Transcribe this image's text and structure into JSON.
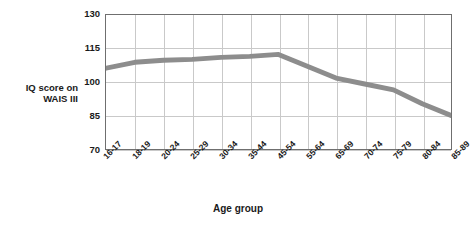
{
  "chart_data": {
    "type": "line",
    "title": "",
    "xlabel": "Age group",
    "ylabel": "IQ score on WAIS III",
    "categories": [
      "16-17",
      "18-19",
      "20-24",
      "25-29",
      "30-34",
      "35-44",
      "45-54",
      "55-64",
      "65-69",
      "70-74",
      "75-79",
      "80-84",
      "85-89"
    ],
    "values": [
      103,
      106,
      107,
      107.5,
      108.5,
      109,
      110,
      104,
      98,
      95,
      92,
      85,
      79
    ],
    "series": [
      {
        "name": "IQ score on WAIS III",
        "values": [
          103,
          106,
          107,
          107.5,
          108.5,
          109,
          110,
          104,
          98,
          95,
          92,
          85,
          79
        ]
      }
    ],
    "yticks": [
      70,
      85,
      100,
      115,
      130
    ],
    "ylim": [
      62,
      130
    ],
    "grid": true,
    "legend": "none",
    "line_color": "#8d8d8d",
    "line_width": 5
  },
  "axes": {
    "y_title_line1": "IQ score on",
    "y_title_line2": "WAIS III",
    "x_title": "Age group",
    "y_tick_labels": [
      "130",
      "115",
      "100",
      "85",
      "70"
    ],
    "x_tick_labels": [
      "16-17",
      "18-19",
      "20-24",
      "25-29",
      "30-34",
      "35-44",
      "45-54",
      "55-64",
      "65-69",
      "70-74",
      "75-79",
      "80-84",
      "85-89"
    ]
  },
  "colors": {
    "line": "#8d8d8d",
    "grid": "#c9c9c9",
    "frame": "#6f6f6f",
    "text": "#1a1a1a",
    "background": "#ffffff"
  }
}
